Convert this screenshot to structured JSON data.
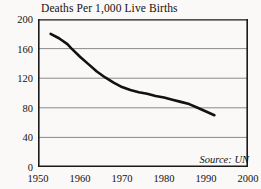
{
  "chart_data": {
    "type": "line",
    "title": "Deaths Per 1,000 Live Births",
    "xlabel": "",
    "ylabel": "",
    "xlim": [
      1950,
      2000
    ],
    "ylim": [
      0,
      200
    ],
    "xticks": [
      "1950",
      "1960",
      "1970",
      "1980",
      "1990",
      "2000"
    ],
    "yticks": [
      "0",
      "40",
      "80",
      "120",
      "160",
      "200"
    ],
    "grid": "horizontal",
    "legend": "none",
    "annotation": "Source: UN",
    "series": [
      {
        "name": "Deaths per 1,000 live births",
        "x": [
          1953,
          1955,
          1957,
          1958,
          1960,
          1962,
          1964,
          1966,
          1968,
          1970,
          1972,
          1974,
          1976,
          1978,
          1980,
          1982,
          1984,
          1986,
          1988,
          1990,
          1992
        ],
        "values": [
          180,
          174,
          166,
          160,
          149,
          139,
          129,
          121,
          114,
          108,
          104,
          101,
          99,
          96,
          94,
          91,
          88,
          85,
          80,
          75,
          70
        ]
      }
    ]
  },
  "figure": {
    "title": "Deaths Per 1,000 Live Births",
    "source_note": "Source: UN",
    "line_color": "#111111",
    "grid_color": "#8a8a8a",
    "axis_color": "#1a1a1a",
    "background": "#faf9f7"
  }
}
